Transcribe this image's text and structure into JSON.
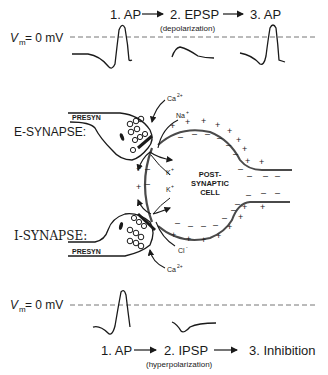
{
  "top_panel": {
    "vm_label": "V",
    "vm_sub": "m",
    "vm_value": " = 0 mV",
    "step1": "1. AP",
    "step2": "2. EPSP",
    "step2_note": "(depolarization)",
    "step3": "3. AP"
  },
  "synapse_diagram": {
    "e_synapse_label": "E-SYNAPSE:",
    "i_synapse_label": "I-SYNAPSE:",
    "presyn_top": "PRESYN",
    "presyn_bottom": "PRESYN",
    "ca_top": "Ca",
    "ca_top_sup": "2+",
    "na": "Na",
    "na_sup": "+",
    "k1": "K",
    "k1_sup": "+",
    "k2": "K",
    "k2_sup": "+",
    "cl": "Cl",
    "cl_sup": "-",
    "ca_bottom": "Ca",
    "ca_bottom_sup": "2+",
    "cell_label_1": "POST-",
    "cell_label_2": "SYNAPTIC",
    "cell_label_3": "CELL"
  },
  "bottom_panel": {
    "vm_label": "V",
    "vm_sub": "m",
    "vm_value": " = 0 mV",
    "step1": "1. AP",
    "step2": "2. IPSP",
    "step2_note": "(hyperpolarization)",
    "step3": "3. Inhibition"
  },
  "colors": {
    "ink": "#1a1a1a",
    "membrane": "#4a4a4a",
    "dashed": "#777777"
  }
}
